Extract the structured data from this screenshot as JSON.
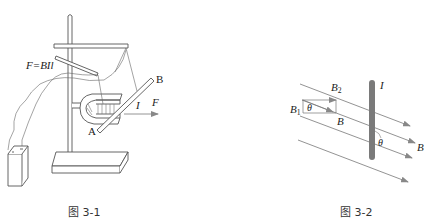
{
  "top_cut_text": "········ ···· ·· — ·······",
  "figure1": {
    "caption": "图 3-1",
    "formula": "F=BIl",
    "labels": {
      "A": "A",
      "B": "B",
      "I": "I",
      "F": "F"
    }
  },
  "figure2": {
    "caption": "图 3-2",
    "labels": {
      "B2_main": "B",
      "B2_sub": "2",
      "B1_main": "B",
      "B1_sub": "1",
      "theta_left": "θ",
      "B_component": "B",
      "I": "I",
      "theta_right": "θ",
      "B_right": "B"
    }
  },
  "colors": {
    "line": "#555555",
    "arrow": "#888888",
    "conductor": "#7a7a7a",
    "text": "#222222"
  }
}
